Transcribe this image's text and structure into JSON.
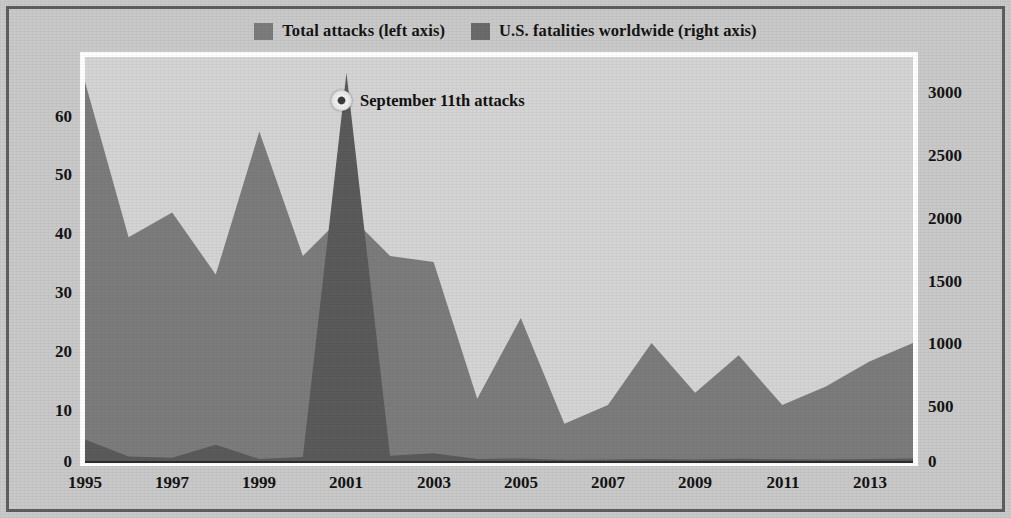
{
  "legend": {
    "entries": [
      {
        "label": "Total attacks (left axis)",
        "swatch": "legend-swatch-attacks",
        "color": "#7c7c7c"
      },
      {
        "label": "U.S. fatalities worldwide (right axis)",
        "swatch": "legend-swatch-fatalities",
        "color": "#6b6b6b"
      }
    ]
  },
  "annotation": {
    "text": "September 11th attacks",
    "marker": "circle-marker-icon"
  },
  "axes": {
    "left_ticks": [
      "60",
      "50",
      "40",
      "30",
      "20",
      "10",
      "0"
    ],
    "right_ticks": [
      "3000",
      "2500",
      "2000",
      "1500",
      "1000",
      "500",
      "0"
    ],
    "x_ticks": [
      "1995",
      "1997",
      "1999",
      "2001",
      "2003",
      "2005",
      "2007",
      "2009",
      "2011",
      "2013"
    ]
  },
  "chart_data": {
    "type": "area",
    "title": "",
    "subtitle": "",
    "xlabel": "",
    "ylabel": "Total attacks",
    "y2label": "U.S. fatalities worldwide",
    "grid": false,
    "legend_position": "top-center",
    "x": [
      1995,
      1996,
      1997,
      1998,
      1999,
      2000,
      2001,
      2002,
      2003,
      2004,
      2005,
      2006,
      2007,
      2008,
      2009,
      2010,
      2011,
      2012,
      2013,
      2014
    ],
    "xlim": [
      1995,
      2014
    ],
    "ylim": [
      0,
      65
    ],
    "y2lim": [
      0,
      3100
    ],
    "series": [
      {
        "name": "Total attacks (left axis)",
        "axis": "left",
        "color": "#7c7c7c",
        "values": [
          61,
          36,
          40,
          30,
          53,
          33,
          40,
          33,
          32,
          10,
          23,
          6,
          9,
          19,
          11,
          17,
          9,
          12,
          16,
          19
        ]
      },
      {
        "name": "U.S. fatalities worldwide (right axis)",
        "axis": "right",
        "color": "#5a5a5a",
        "values": [
          165,
          35,
          25,
          125,
          15,
          30,
          2980,
          40,
          60,
          15,
          20,
          10,
          12,
          15,
          12,
          18,
          14,
          12,
          16,
          20
        ]
      }
    ],
    "annotations": [
      {
        "text": "September 11th attacks",
        "x": 2001,
        "y2": 2980
      }
    ]
  }
}
